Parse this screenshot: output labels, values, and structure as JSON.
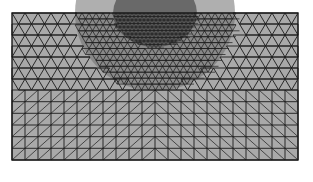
{
  "figure": {
    "type": "triangular-mesh",
    "canvas": {
      "width": 313,
      "height": 182,
      "background": "#ffffff"
    },
    "domain": {
      "x0": 12,
      "y0": 13,
      "x1": 298,
      "y1": 160
    },
    "colors": {
      "fill": "#a9a9a9",
      "edge": "#1a1a1a",
      "dense_fill": "#6e6e6e"
    },
    "refinement": {
      "center_x": 155,
      "center_y": 13,
      "outer_rx": 80,
      "outer_ry": 78,
      "inner_rx": 42,
      "inner_ry": 34
    },
    "structured_zone": {
      "y_start": 90,
      "cols": 22,
      "rows": 6,
      "left_diag": "/",
      "right_diag": "\\"
    },
    "coarse_cell": 13,
    "medium_cell": 7,
    "fine_cell": 4
  }
}
